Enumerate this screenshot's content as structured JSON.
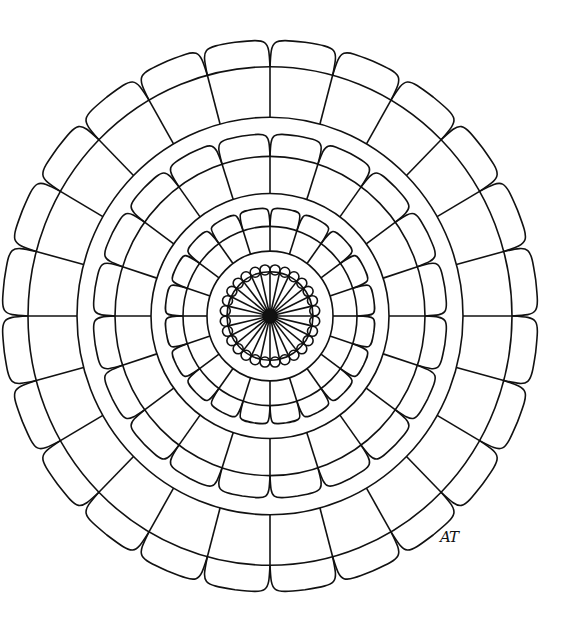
{
  "artwork": {
    "type": "mandala coloring page",
    "signature": "AT",
    "line_color": "#111111",
    "background": "#ffffff",
    "center": [
      270,
      316
    ],
    "layers": [
      {
        "name": "hub",
        "spokes": 28,
        "circle_r": 43,
        "scallops": 28
      },
      {
        "name": "inner-band",
        "inner_r": 63,
        "outer_r": 87,
        "segments": 20,
        "scallop_tip_r": 105
      },
      {
        "name": "middle-band",
        "inner_r": 119,
        "outer_r": 155,
        "segments": 20,
        "scallop_tip_r": 177
      },
      {
        "name": "outer-band",
        "inner_r": 193,
        "outer_r": 242,
        "segments": 24,
        "scallop_tip_r": 268
      }
    ]
  }
}
